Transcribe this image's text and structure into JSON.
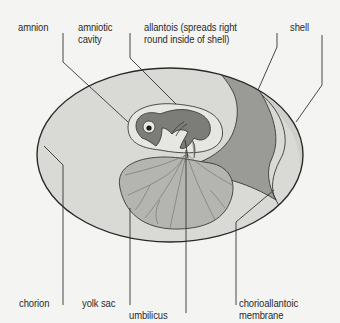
{
  "figure": {
    "colors": {
      "background": "#f4f4f2",
      "outline": "#3a3a3a",
      "egg_interior": "#d9d9d6",
      "allantois": "#9a9a97",
      "amnion_fill": "#e6e6e3",
      "embryo": "#7c7c79",
      "yolk_sac": "#b4b4b1",
      "chorioallantoic_band": "#cfcfcc",
      "leader_line": "#333333"
    }
  },
  "labels": {
    "amnion": {
      "text": "amnion"
    },
    "amniotic_cavity": {
      "line1": "amniotic",
      "line2": "cavity"
    },
    "allantois": {
      "line1": "allantois (spreads right",
      "line2": "round inside of shell)"
    },
    "shell": {
      "text": "shell"
    },
    "chorion": {
      "text": "chorion"
    },
    "yolk_sac": {
      "text": "yolk sac"
    },
    "umbilicus": {
      "text": "umbilicus"
    },
    "chorioallantoic_membrane": {
      "line1": "chorioallantoic",
      "line2": "membrane"
    }
  }
}
